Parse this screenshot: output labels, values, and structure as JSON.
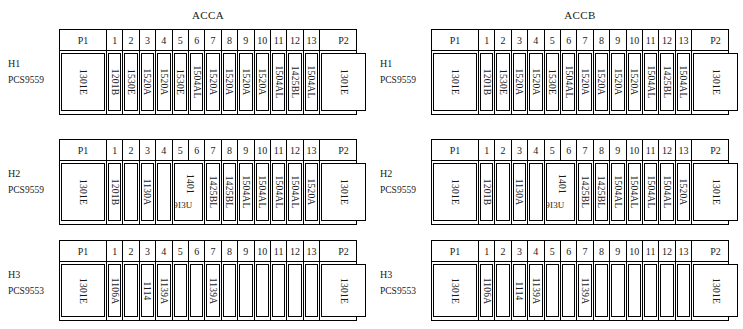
{
  "panels": [
    {
      "title": "ACCA",
      "rows": [
        {
          "label_line1": "H1",
          "label_line2": "PCS9559",
          "headers": [
            "P1",
            "1",
            "2",
            "3",
            "4",
            "5",
            "6",
            "7",
            "8",
            "9",
            "10",
            "11",
            "12",
            "13",
            "P2"
          ],
          "values": [
            "1301E",
            "1201B",
            "1530E",
            "1520A",
            "1520A",
            "1530E",
            "1504AL",
            "1520A",
            "1520A",
            "1520A",
            "1520A",
            "1504AL",
            "1425BL",
            "1504AL",
            "1301E"
          ]
        },
        {
          "label_line1": "H2",
          "label_line2": "PCS9559",
          "headers": [
            "P1",
            "1",
            "2",
            "3",
            "4",
            "5",
            "6",
            "7",
            "8",
            "9",
            "10",
            "11",
            "12",
            "13",
            "P2"
          ],
          "values": [
            "1301E",
            "1201B",
            "",
            "1130A",
            "",
            "1401",
            "1425BL",
            "1425BL",
            "1504AL",
            "1504AL",
            "1504AL",
            "1504AL",
            "1520A",
            "1301E"
          ],
          "merged_label_upper": "1401",
          "merged_label_lower": "9I3U"
        },
        {
          "label_line1": "H3",
          "label_line2": "PCS9553",
          "headers": [
            "P1",
            "1",
            "2",
            "3",
            "4",
            "5",
            "6",
            "7",
            "8",
            "9",
            "10",
            "11",
            "12",
            "13",
            "P2"
          ],
          "values": [
            "1301E",
            "1106A",
            "",
            "1114",
            "1139A",
            "",
            "",
            "1139A",
            "",
            "",
            "",
            "",
            "",
            "",
            "1301E"
          ]
        }
      ]
    },
    {
      "title": "ACCB",
      "rows": [
        {
          "label_line1": "H1",
          "label_line2": "PCS9559",
          "headers": [
            "P1",
            "1",
            "2",
            "3",
            "4",
            "5",
            "6",
            "7",
            "8",
            "9",
            "10",
            "11",
            "12",
            "13",
            "P2"
          ],
          "values": [
            "1301E",
            "1201B",
            "1530E",
            "1520A",
            "1520A",
            "1530E",
            "1504AL",
            "1520A",
            "1520A",
            "1520A",
            "1520A",
            "1504AL",
            "1425BL",
            "1504AL",
            "1301E"
          ]
        },
        {
          "label_line1": "H2",
          "label_line2": "PCS9559",
          "headers": [
            "P1",
            "1",
            "2",
            "3",
            "4",
            "5",
            "6",
            "7",
            "8",
            "9",
            "10",
            "11",
            "12",
            "13",
            "P2"
          ],
          "values": [
            "1301E",
            "1201B",
            "",
            "1130A",
            "",
            "1401",
            "1425BL",
            "1425BL",
            "1504AL",
            "1504AL",
            "1504AL",
            "1504AL",
            "1520A",
            "1301E"
          ],
          "merged_label_upper": "1401",
          "merged_label_lower": "9I3U"
        },
        {
          "label_line1": "H3",
          "label_line2": "PCS9553",
          "headers": [
            "P1",
            "1",
            "2",
            "3",
            "4",
            "5",
            "6",
            "7",
            "8",
            "9",
            "10",
            "11",
            "12",
            "13",
            "P2"
          ],
          "values": [
            "1301E",
            "1106A",
            "",
            "1114",
            "1139A",
            "",
            "",
            "1139A",
            "",
            "",
            "",
            "",
            "",
            "",
            "1301E"
          ]
        }
      ]
    }
  ]
}
